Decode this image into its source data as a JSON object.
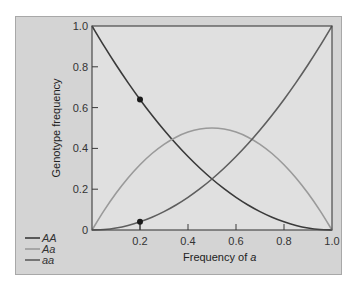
{
  "chart_data": {
    "type": "line",
    "title": "",
    "xlabel": "Frequency of a",
    "xlabel_prefix": "Frequency of ",
    "xlabel_var": "a",
    "ylabel": "Genotype frequency",
    "xlim": [
      0,
      1.0
    ],
    "ylim": [
      0,
      1.0
    ],
    "x_ticks": [
      0.2,
      0.4,
      0.6,
      0.8,
      1.0
    ],
    "x_tick_labels": [
      "0.2",
      "0.4",
      "0.6",
      "0.8",
      "1.0"
    ],
    "y_ticks": [
      0,
      0.2,
      0.4,
      0.6,
      0.8,
      1.0
    ],
    "y_tick_labels": [
      "0",
      "0.2",
      "0.4",
      "0.6",
      "0.8",
      "1.0"
    ],
    "grid": false,
    "legend_position": "lower-left outside plot",
    "x": [
      0,
      0.05,
      0.1,
      0.15,
      0.2,
      0.25,
      0.3,
      0.35,
      0.4,
      0.45,
      0.5,
      0.55,
      0.6,
      0.65,
      0.7,
      0.75,
      0.8,
      0.85,
      0.9,
      0.95,
      1.0
    ],
    "series": [
      {
        "name": "AA",
        "formula": "(1-q)^2",
        "color": "#3a3a3a",
        "values": [
          1.0,
          0.9025,
          0.81,
          0.7225,
          0.64,
          0.5625,
          0.49,
          0.4225,
          0.36,
          0.3025,
          0.25,
          0.2025,
          0.16,
          0.1225,
          0.09,
          0.0625,
          0.04,
          0.0225,
          0.01,
          0.0025,
          0.0
        ]
      },
      {
        "name": "Aa",
        "formula": "2q(1-q)",
        "color": "#9a9a9a",
        "values": [
          0.0,
          0.095,
          0.18,
          0.255,
          0.32,
          0.375,
          0.42,
          0.455,
          0.48,
          0.495,
          0.5,
          0.495,
          0.48,
          0.455,
          0.42,
          0.375,
          0.32,
          0.255,
          0.18,
          0.095,
          0.0
        ]
      },
      {
        "name": "aa",
        "formula": "q^2",
        "color": "#5e5e5e",
        "values": [
          0.0,
          0.0025,
          0.01,
          0.0225,
          0.04,
          0.0625,
          0.09,
          0.1225,
          0.16,
          0.2025,
          0.25,
          0.3025,
          0.36,
          0.4225,
          0.49,
          0.5625,
          0.64,
          0.7225,
          0.81,
          0.9025,
          1.0
        ]
      }
    ],
    "markers": [
      {
        "x": 0.2,
        "y": 0.64,
        "series": "AA"
      },
      {
        "x": 0.2,
        "y": 0.04,
        "series": "aa"
      }
    ],
    "marker_tick_x": 0.2
  },
  "legend": {
    "items": [
      {
        "label": "AA",
        "color": "#3a3a3a"
      },
      {
        "label": "Aa",
        "color": "#9a9a9a"
      },
      {
        "label": "aa",
        "color": "#5e5e5e"
      }
    ]
  },
  "colors": {
    "panel_bg": "#d4d4d4",
    "plot_bg": "#e0e0e0",
    "axis": "#3a3a3a"
  }
}
